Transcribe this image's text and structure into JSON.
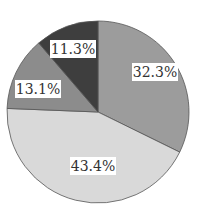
{
  "chart_data": {
    "type": "pie",
    "title": "",
    "start_angle_deg": 90,
    "direction": "clockwise",
    "slices": [
      {
        "label": "32.3%",
        "value": 32.3,
        "color": "#9c9c9c"
      },
      {
        "label": "43.4%",
        "value": 43.4,
        "color": "#d9d9d9"
      },
      {
        "label": "13.1%",
        "value": 13.1,
        "color": "#8c8c8c"
      },
      {
        "label": "11.3%",
        "value": 11.3,
        "color": "#3e3e3e"
      }
    ],
    "legend": "none"
  }
}
